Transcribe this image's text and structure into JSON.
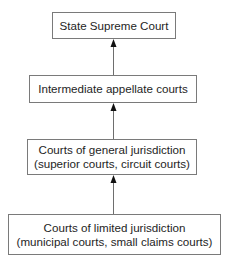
{
  "diagram": {
    "type": "hierarchy",
    "direction": "bottom-to-top",
    "nodes": [
      {
        "id": "state-supreme-court",
        "lines": [
          "State Supreme Court"
        ]
      },
      {
        "id": "intermediate-appellate-courts",
        "lines": [
          "Intermediate appellate courts"
        ]
      },
      {
        "id": "courts-general-jurisdiction",
        "lines": [
          "Courts of general jurisdiction",
          "(superior courts, circuit courts)"
        ]
      },
      {
        "id": "courts-limited-jurisdiction",
        "lines": [
          "Courts of limited jurisdiction",
          "(municipal courts, small claims courts)"
        ]
      }
    ],
    "edges": [
      {
        "from": "intermediate-appellate-courts",
        "to": "state-supreme-court"
      },
      {
        "from": "courts-general-jurisdiction",
        "to": "intermediate-appellate-courts"
      },
      {
        "from": "courts-limited-jurisdiction",
        "to": "courts-general-jurisdiction"
      }
    ],
    "colors": {
      "border": "#7a7a7a",
      "arrow": "#6e6e6e",
      "arrowhead": "#111111",
      "text": "#1e1e1e",
      "background": "#ffffff"
    }
  }
}
